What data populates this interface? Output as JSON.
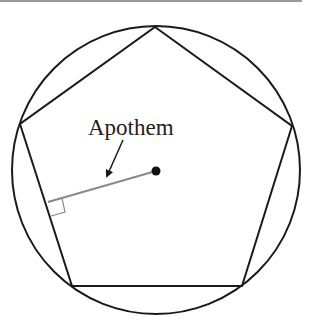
{
  "diagram": {
    "label": "Apothem",
    "colors": {
      "stroke": "#1a1a1a",
      "apothem": "#8a8a8a",
      "rule": "#9a9a9a",
      "background": "#ffffff"
    },
    "circle": {
      "cx": 156,
      "cy": 170,
      "r": 144
    },
    "pentagon_vertices": [
      [
        155,
        27
      ],
      [
        292,
        126
      ],
      [
        242,
        286
      ],
      [
        72,
        286
      ],
      [
        20,
        124
      ]
    ],
    "center_point": [
      156,
      171
    ],
    "apothem_foot": [
      48,
      202
    ],
    "right_angle_marker": [
      [
        48,
        202
      ],
      [
        62,
        198
      ],
      [
        65,
        212
      ],
      [
        51,
        216
      ]
    ],
    "arrow": {
      "from": [
        123,
        140
      ],
      "to": [
        107,
        176
      ]
    },
    "label_position": [
      88,
      135
    ]
  }
}
